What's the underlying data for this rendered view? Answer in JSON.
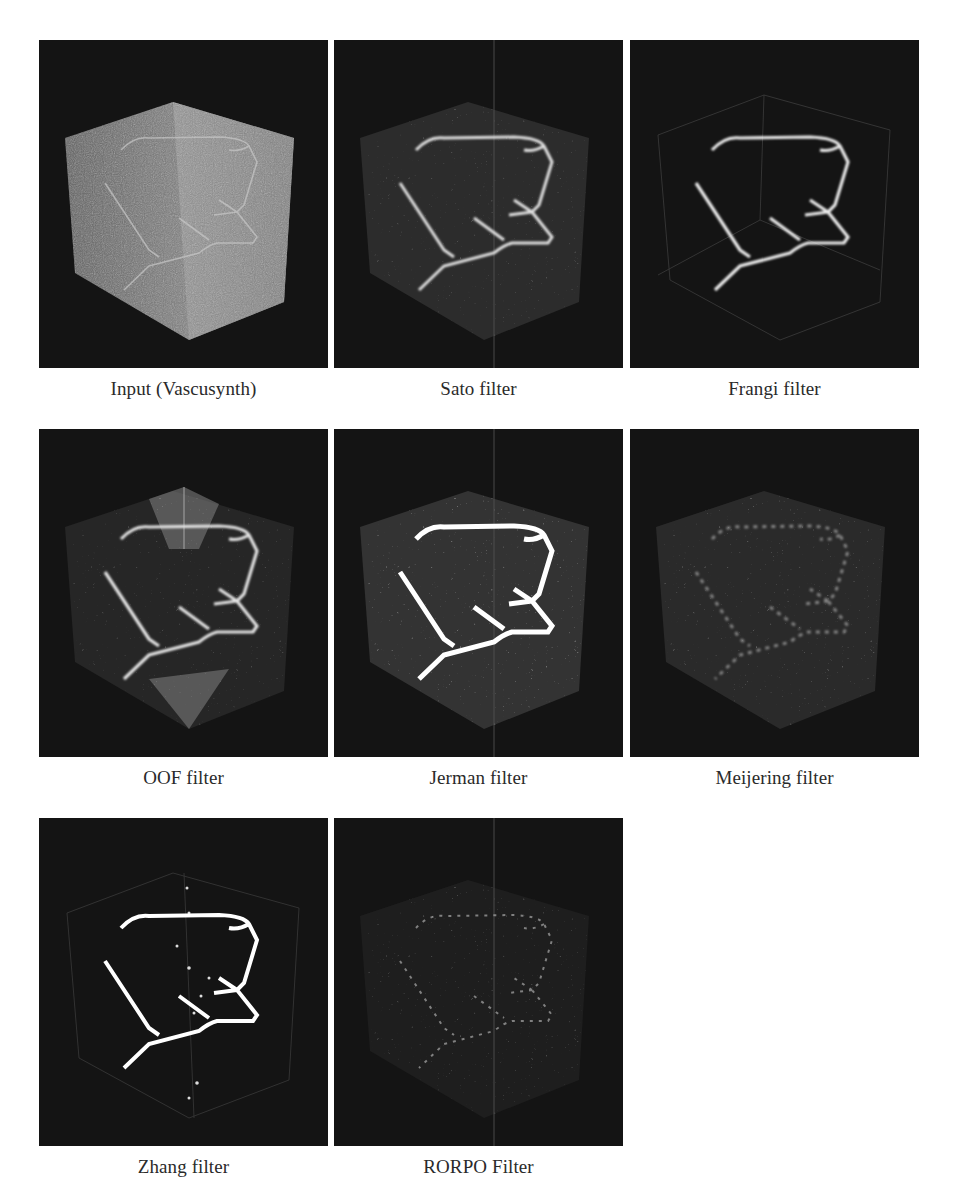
{
  "figure": {
    "panels": [
      {
        "id": "input",
        "caption": "Input (Vascusynth)"
      },
      {
        "id": "sato",
        "caption": "Sato filter"
      },
      {
        "id": "frangi",
        "caption": "Frangi filter"
      },
      {
        "id": "oof",
        "caption": "OOF filter"
      },
      {
        "id": "jerman",
        "caption": "Jerman filter"
      },
      {
        "id": "meijering",
        "caption": "Meijering filter"
      },
      {
        "id": "zhang",
        "caption": "Zhang filter"
      },
      {
        "id": "rorpo",
        "caption": "RORPO Filter"
      }
    ]
  },
  "colors": {
    "panel_background": "#141414",
    "vessel": "#e8e8e8",
    "cube_face": "#8a8a8a",
    "page_background": "#ffffff"
  }
}
